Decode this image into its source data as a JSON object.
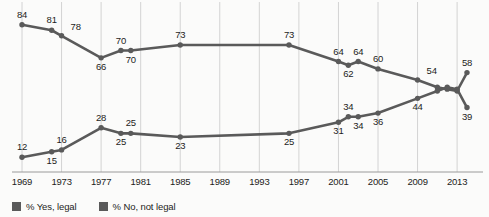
{
  "chart_data": {
    "type": "line",
    "title": "",
    "xlabel": "",
    "ylabel": "",
    "xlim": [
      1969,
      2014
    ],
    "ylim": [
      0,
      100
    ],
    "grid": true,
    "legend_position": "bottom-left",
    "xticks": [
      1969,
      1973,
      1977,
      1981,
      1985,
      1989,
      1993,
      1997,
      2001,
      2005,
      2009,
      2013
    ],
    "xtick_labels": [
      "1969",
      "1973",
      "1977",
      "1981",
      "1985",
      "1989",
      "1993",
      "1997",
      "2001",
      "2005",
      "2009",
      "2013"
    ],
    "series": [
      {
        "name": "% Yes, legal",
        "color": "#5a5a5a",
        "x": [
          1969,
          1972,
          1973,
          1977,
          1979,
          1980,
          1985,
          1996,
          2001,
          2002,
          2003,
          2005,
          2009,
          2011,
          2012,
          2013,
          2014
        ],
        "values": [
          84,
          81,
          78,
          66,
          70,
          70,
          73,
          73,
          64,
          62,
          64,
          60,
          54,
          50,
          49,
          48,
          58
        ],
        "labels": [
          {
            "x": 1969,
            "value": 84,
            "text": "84",
            "pos": "above"
          },
          {
            "x": 1972,
            "value": 81,
            "text": "81",
            "pos": "above"
          },
          {
            "x": 1973,
            "value": 78,
            "text": "78",
            "pos": "above-right"
          },
          {
            "x": 1977,
            "value": 66,
            "text": "66",
            "pos": "below"
          },
          {
            "x": 1979,
            "value": 70,
            "text": "70",
            "pos": "above"
          },
          {
            "x": 1980,
            "value": 70,
            "text": "70",
            "pos": "below"
          },
          {
            "x": 1985,
            "value": 73,
            "text": "73",
            "pos": "above"
          },
          {
            "x": 1996,
            "value": 73,
            "text": "73",
            "pos": "above"
          },
          {
            "x": 2001,
            "value": 64,
            "text": "64",
            "pos": "above"
          },
          {
            "x": 2002,
            "value": 62,
            "text": "62",
            "pos": "below"
          },
          {
            "x": 2003,
            "value": 64,
            "text": "64",
            "pos": "above"
          },
          {
            "x": 2005,
            "value": 60,
            "text": "60",
            "pos": "above"
          },
          {
            "x": 2009,
            "value": 54,
            "text": "54",
            "pos": "above-right"
          },
          {
            "x": 2014,
            "value": 58,
            "text": "58",
            "pos": "above"
          }
        ]
      },
      {
        "name": "% No, not legal",
        "color": "#5a5a5a",
        "x": [
          1969,
          1972,
          1973,
          1977,
          1979,
          1980,
          1985,
          1996,
          2001,
          2002,
          2003,
          2005,
          2009,
          2011,
          2012,
          2013,
          2014
        ],
        "values": [
          12,
          15,
          16,
          28,
          25,
          25,
          23,
          25,
          31,
          34,
          34,
          36,
          44,
          48,
          50,
          49,
          39
        ],
        "labels": [
          {
            "x": 1969,
            "value": 12,
            "text": "12",
            "pos": "above"
          },
          {
            "x": 1972,
            "value": 15,
            "text": "15",
            "pos": "below"
          },
          {
            "x": 1973,
            "value": 16,
            "text": "16",
            "pos": "above"
          },
          {
            "x": 1977,
            "value": 28,
            "text": "28",
            "pos": "above"
          },
          {
            "x": 1979,
            "value": 25,
            "text": "25",
            "pos": "below"
          },
          {
            "x": 1980,
            "value": 25,
            "text": "25",
            "pos": "above"
          },
          {
            "x": 1985,
            "value": 23,
            "text": "23",
            "pos": "below"
          },
          {
            "x": 1996,
            "value": 25,
            "text": "25",
            "pos": "below"
          },
          {
            "x": 2001,
            "value": 31,
            "text": "31",
            "pos": "below"
          },
          {
            "x": 2002,
            "value": 34,
            "text": "34",
            "pos": "above"
          },
          {
            "x": 2003,
            "value": 34,
            "text": "34",
            "pos": "below"
          },
          {
            "x": 2005,
            "value": 36,
            "text": "36",
            "pos": "below"
          },
          {
            "x": 2009,
            "value": 44,
            "text": "44",
            "pos": "below-right"
          },
          {
            "x": 2014,
            "value": 39,
            "text": "39",
            "pos": "below"
          }
        ]
      }
    ]
  },
  "legend": {
    "items": [
      {
        "label": "% Yes, legal",
        "color": "#5a5a5a"
      },
      {
        "label": "% No, not legal",
        "color": "#5a5a5a"
      }
    ]
  },
  "colors": {
    "line": "#5a5a5a",
    "grid": "#c9c9c9",
    "axis": "#9a9a9a",
    "text": "#1d1d1b",
    "background": "#fbfbfa"
  }
}
